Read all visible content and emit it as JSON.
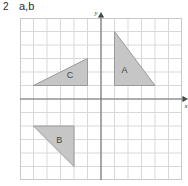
{
  "header": {
    "item_number": "2",
    "parts": "a,b"
  },
  "figure": {
    "name": "coordinate-grid-with-triangles",
    "colors": {
      "grid_line": "#d9d9d9",
      "grid_border": "#c9c9c9",
      "axis": "#6e6e6e",
      "triangle_fill": "#c6c6c6",
      "triangle_stroke": "#9a9a9a",
      "label_text": "#444444",
      "background": "#ffffff"
    },
    "grid": {
      "cell_size": 13.5,
      "columns": 12,
      "rows": 12,
      "x_range": [
        -6,
        6
      ],
      "y_range": [
        -6,
        6
      ],
      "show_grid": true,
      "show_tick_numbers": false
    },
    "axes": {
      "x_axis": {
        "label": "x",
        "arrow": "right"
      },
      "y_axis": {
        "label": "y",
        "arrow": "up"
      },
      "origin": [
        0,
        0
      ]
    },
    "shapes": [
      {
        "label": "A",
        "type": "right-triangle",
        "vertices": [
          [
            1,
            5
          ],
          [
            1,
            1
          ],
          [
            4,
            1
          ]
        ],
        "label_position": [
          1.75,
          2.1
        ]
      },
      {
        "label": "B",
        "type": "right-triangle",
        "vertices": [
          [
            -5,
            -2
          ],
          [
            -2,
            -2
          ],
          [
            -2,
            -5
          ]
        ],
        "label_position": [
          -3.1,
          -3.1
        ]
      },
      {
        "label": "C",
        "type": "right-triangle",
        "vertices": [
          [
            -5,
            1
          ],
          [
            -1,
            1
          ],
          [
            -1,
            3
          ]
        ],
        "label_position": [
          -2.3,
          1.7
        ]
      }
    ]
  }
}
